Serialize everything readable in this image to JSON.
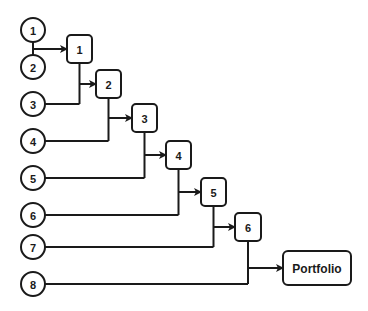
{
  "diagram": {
    "type": "cumulative-merge-tree",
    "colors": {
      "stroke": "#1a1a1a",
      "fill": "#ffffff",
      "text": "#1a1a1a"
    },
    "inputs": [
      {
        "label": "1",
        "cx": 33,
        "cy": 30
      },
      {
        "label": "2",
        "cx": 33,
        "cy": 67
      },
      {
        "label": "3",
        "cx": 33,
        "cy": 104
      },
      {
        "label": "4",
        "cx": 33,
        "cy": 141
      },
      {
        "label": "5",
        "cx": 33,
        "cy": 178
      },
      {
        "label": "6",
        "cx": 33,
        "cy": 215
      },
      {
        "label": "7",
        "cx": 33,
        "cy": 247
      },
      {
        "label": "8",
        "cx": 33,
        "cy": 284
      }
    ],
    "stages": [
      {
        "label": "1",
        "x": 67,
        "y": 35,
        "w": 25,
        "h": 28
      },
      {
        "label": "2",
        "x": 96,
        "y": 70,
        "w": 25,
        "h": 28
      },
      {
        "label": "3",
        "x": 132,
        "y": 104,
        "w": 25,
        "h": 28
      },
      {
        "label": "4",
        "x": 166,
        "y": 141,
        "w": 25,
        "h": 28
      },
      {
        "label": "5",
        "x": 201,
        "y": 178,
        "w": 25,
        "h": 28
      },
      {
        "label": "6",
        "x": 235,
        "y": 213,
        "w": 26,
        "h": 28
      }
    ],
    "output": {
      "label": "Portfolio",
      "x": 283,
      "y": 251,
      "w": 68,
      "h": 34
    }
  }
}
